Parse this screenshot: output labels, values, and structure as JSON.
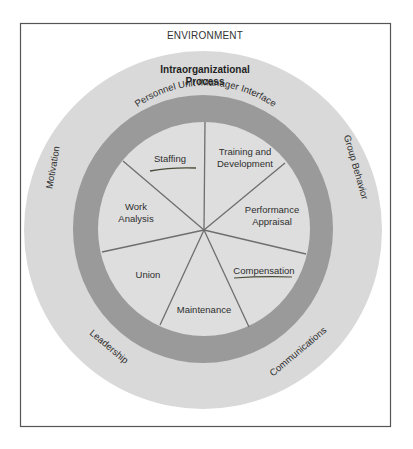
{
  "diagram": {
    "environment_label": "ENVIRONMENT",
    "process_label_line1": "Intraorganizational",
    "process_label_line2": "Process",
    "ring_label": "Personnel Unit /Manager Interface",
    "outer_factors": {
      "motivation": "Motivation",
      "group_behavior": "Group Behavior",
      "leadership": "Leadership",
      "communications": "Communications"
    },
    "segments": [
      {
        "id": "staffing",
        "lines": [
          "Staffing"
        ],
        "underlined": true
      },
      {
        "id": "training",
        "lines": [
          "Training and",
          "Development"
        ],
        "underlined": false
      },
      {
        "id": "performance",
        "lines": [
          "Performance",
          "Appraisal"
        ],
        "underlined": false
      },
      {
        "id": "compensation",
        "lines": [
          "Compensation"
        ],
        "underlined": true
      },
      {
        "id": "maintenance",
        "lines": [
          "Maintenance"
        ],
        "underlined": false
      },
      {
        "id": "union",
        "lines": [
          "Union"
        ],
        "underlined": false
      },
      {
        "id": "work-analysis",
        "lines": [
          "Work",
          "Analysis"
        ],
        "underlined": false
      }
    ],
    "colors": {
      "outer_circle": "#d9d9d9",
      "ring": "#9a9a9a",
      "inner_circle": "#dedede",
      "spokes": "#6e6e6e",
      "frame": "#555555",
      "underline": "#4a4d3a"
    }
  }
}
